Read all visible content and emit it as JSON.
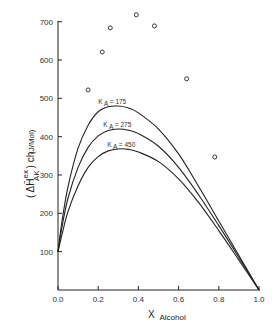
{
  "chart_data": {
    "type": "line",
    "title": "",
    "xlabel": "X",
    "xlabel_sub": "Alcohol",
    "ylabel_main": "( ΔH̄",
    "ylabel_sup": "ex",
    "ylabel_sub": "AK",
    "ylabel_tail": ") ch",
    "ylabel_units": "(J/Mol)",
    "xlim": [
      0.0,
      1.0
    ],
    "ylim": [
      0,
      700
    ],
    "xticks": [
      "0.0",
      "0.2",
      "0.4",
      "0.6",
      "0.8",
      "1.0"
    ],
    "yticks": [
      "100",
      "200",
      "300",
      "400",
      "500",
      "600",
      "700"
    ],
    "grid": false,
    "series": [
      {
        "name": "K A = 175",
        "label_prefix": "K",
        "label_sub": "A",
        "label_value": "= 175",
        "label_pos": [
          0.2,
          485
        ],
        "x": [
          0.0,
          0.02,
          0.05,
          0.1,
          0.15,
          0.2,
          0.25,
          0.3,
          0.35,
          0.4,
          0.5,
          0.6,
          0.7,
          0.8,
          0.9,
          1.0
        ],
        "values": [
          100,
          180,
          270,
          370,
          430,
          465,
          478,
          480,
          475,
          462,
          420,
          355,
          270,
          180,
          90,
          0
        ]
      },
      {
        "name": "K A = 275",
        "label_prefix": "K",
        "label_sub": "A",
        "label_value": "= 275",
        "label_pos": [
          0.225,
          425
        ],
        "x": [
          0.0,
          0.02,
          0.05,
          0.1,
          0.15,
          0.2,
          0.25,
          0.3,
          0.35,
          0.4,
          0.5,
          0.6,
          0.7,
          0.8,
          0.9,
          1.0
        ],
        "values": [
          100,
          165,
          240,
          320,
          372,
          402,
          416,
          420,
          417,
          408,
          375,
          320,
          248,
          168,
          85,
          0
        ]
      },
      {
        "name": "K A = 450",
        "label_prefix": "K",
        "label_sub": "A",
        "label_value": "= 450",
        "label_pos": [
          0.245,
          372
        ],
        "x": [
          0.0,
          0.02,
          0.05,
          0.1,
          0.15,
          0.2,
          0.25,
          0.3,
          0.35,
          0.4,
          0.5,
          0.6,
          0.7,
          0.8,
          0.9,
          1.0
        ],
        "values": [
          100,
          145,
          205,
          272,
          320,
          348,
          363,
          368,
          367,
          360,
          335,
          290,
          228,
          155,
          78,
          0
        ]
      }
    ],
    "scatter": {
      "name": "experimental",
      "marker": "open-circle",
      "x": [
        0.15,
        0.22,
        0.26,
        0.39,
        0.48,
        0.64,
        0.78
      ],
      "values": [
        522,
        621,
        684,
        718,
        689,
        551,
        347
      ]
    }
  }
}
